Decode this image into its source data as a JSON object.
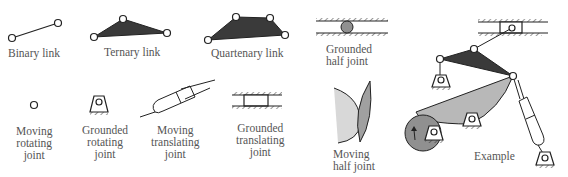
{
  "labels": {
    "binary_link": "Binary link",
    "ternary_link": "Ternary link",
    "quartenary_link": "Quartenary link",
    "grounded_half_joint": [
      "Grounded",
      "half joint"
    ],
    "moving_rotating_joint": [
      "Moving",
      "rotating",
      "joint"
    ],
    "grounded_rotating_joint": [
      "Grounded",
      "rotating",
      "joint"
    ],
    "moving_translating_joint": [
      "Moving",
      "translating",
      "joint"
    ],
    "grounded_translating_joint": [
      "Grounded",
      "translating",
      "joint"
    ],
    "moving_half_joint": [
      "Moving",
      "half joint"
    ],
    "example": "Example"
  },
  "colors": {
    "dark_link": "#3a3a3a",
    "light_link": "#b8b8b8",
    "circle_fill": "#909090",
    "stroke": "#222222",
    "label": "#555555"
  }
}
